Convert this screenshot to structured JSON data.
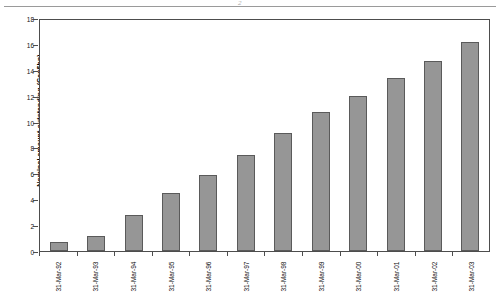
{
  "chart_data": {
    "type": "bar",
    "title": "",
    "xlabel": "",
    "ylabel": "Nominal amount outstanding (Can$bn)",
    "categories": [
      "31-Mar-92",
      "31-Mar-93",
      "31-Mar-94",
      "31-Mar-95",
      "31-Mar-96",
      "31-Mar-97",
      "31-Mar-98",
      "31-Mar-99",
      "31-Mar-00",
      "31-Mar-01",
      "31-Mar-02",
      "31-Mar-03"
    ],
    "values": [
      0.7,
      1.2,
      2.8,
      4.5,
      5.9,
      7.5,
      9.2,
      10.8,
      12.1,
      13.5,
      14.8,
      16.3
    ],
    "ylim": [
      0,
      18
    ],
    "yticks": [
      0,
      2,
      4,
      6,
      8,
      10,
      12,
      14,
      16,
      18
    ],
    "ytick_labels": [
      "0",
      "2",
      "4",
      "6",
      "8",
      "10",
      "12",
      "14",
      "16",
      "18"
    ],
    "grid": false,
    "legend": null,
    "series_color": "#969696",
    "axis_color": "#4d4d4d"
  },
  "figure": {
    "top_rule_mark": "2"
  }
}
